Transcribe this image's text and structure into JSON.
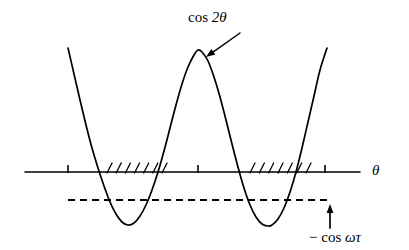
{
  "figure": {
    "title": "",
    "background_color": "#ffffff",
    "ink_color": "#000000",
    "width": 409,
    "height": 250
  },
  "labels": {
    "curve_label": "cos 2θ",
    "curve_label_parts": {
      "fn": "cos",
      "arg": "2θ"
    },
    "axis_label": "θ",
    "dashed_label": "− cos ωτ",
    "dashed_label_parts": {
      "sign": "−",
      "fn": "cos",
      "arg": "ωτ"
    }
  },
  "chart_data": {
    "type": "line",
    "title": "",
    "xlabel": "θ",
    "ylabel": "",
    "grid": false,
    "legend": null,
    "annotations": [
      {
        "name": "curve-annotation",
        "text": "cos 2θ",
        "text_x": 215,
        "text_y": 20,
        "arrow_from_x": 240,
        "arrow_from_y": 33,
        "arrow_to_x": 206,
        "arrow_to_y": 57
      },
      {
        "name": "threshold-annotation",
        "text": "− cos ωτ",
        "text_x": 332,
        "text_y": 238,
        "arrow_from_x": 330,
        "arrow_from_y": 228,
        "arrow_to_x": 330,
        "arrow_to_y": 204
      }
    ],
    "series": [
      {
        "name": "cos 2θ",
        "style": "solid",
        "description": "Cosine of twice theta, two full troughs and a central crest",
        "points": [
          [
            68,
            48
          ],
          [
            74,
            74
          ],
          [
            80,
            100
          ],
          [
            86,
            125
          ],
          [
            92,
            148
          ],
          [
            98,
            168
          ],
          [
            104,
            186
          ],
          [
            110,
            202
          ],
          [
            116,
            214
          ],
          [
            122,
            222
          ],
          [
            128,
            225
          ],
          [
            134,
            223
          ],
          [
            140,
            216
          ],
          [
            146,
            205
          ],
          [
            152,
            190
          ],
          [
            158,
            172
          ],
          [
            164,
            151
          ],
          [
            170,
            128
          ],
          [
            176,
            105
          ],
          [
            182,
            84
          ],
          [
            188,
            67
          ],
          [
            194,
            55
          ],
          [
            198,
            50
          ],
          [
            202,
            52
          ],
          [
            208,
            61
          ],
          [
            214,
            77
          ],
          [
            220,
            97
          ],
          [
            226,
            120
          ],
          [
            232,
            144
          ],
          [
            238,
            167
          ],
          [
            244,
            188
          ],
          [
            250,
            205
          ],
          [
            256,
            217
          ],
          [
            262,
            224
          ],
          [
            268,
            226
          ],
          [
            272,
            225
          ],
          [
            278,
            219
          ],
          [
            284,
            208
          ],
          [
            290,
            192
          ],
          [
            296,
            172
          ],
          [
            302,
            148
          ],
          [
            308,
            122
          ],
          [
            314,
            96
          ],
          [
            320,
            70
          ],
          [
            327,
            48
          ]
        ]
      },
      {
        "name": "− cos ωτ",
        "style": "dashed",
        "description": "Horizontal threshold level below the axis",
        "y": 200,
        "x_start": 68,
        "x_end": 332
      }
    ],
    "axis": {
      "name": "theta-axis",
      "y": 172,
      "x_start": 25,
      "x_end": 360,
      "ticks": [
        {
          "x": 68,
          "label": ""
        },
        {
          "x": 198,
          "label": ""
        },
        {
          "x": 325,
          "label": ""
        }
      ]
    },
    "hatching": [
      {
        "name": "hatch-region-left",
        "x_start": 107,
        "x_end": 162,
        "count": 7,
        "side": "above-axis",
        "meaning": "forbidden/unstable band where cos 2θ lies below −cos ωτ"
      },
      {
        "name": "hatch-region-right",
        "x_start": 250,
        "x_end": 306,
        "count": 7,
        "side": "above-axis",
        "meaning": "forbidden/unstable band where cos 2θ lies below −cos ωτ"
      }
    ]
  }
}
